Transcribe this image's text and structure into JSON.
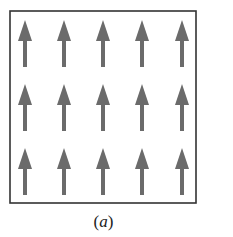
{
  "figure": {
    "caption_open": "(",
    "caption_letter": "a",
    "caption_close": ")",
    "box": {
      "x": 10,
      "y": 11,
      "width": 186,
      "height": 192,
      "stroke": "#333333"
    },
    "arrow_color": "#6b6b6b",
    "arrow_direction": "up",
    "grid": {
      "rows": 3,
      "cols": 5,
      "col_centers_x": [
        25,
        64,
        103,
        142,
        182
      ],
      "row_tips_y": [
        20,
        84,
        148
      ],
      "arrow_length": 47,
      "head_height": 21,
      "head_width": 14,
      "shaft_width": 4
    }
  }
}
